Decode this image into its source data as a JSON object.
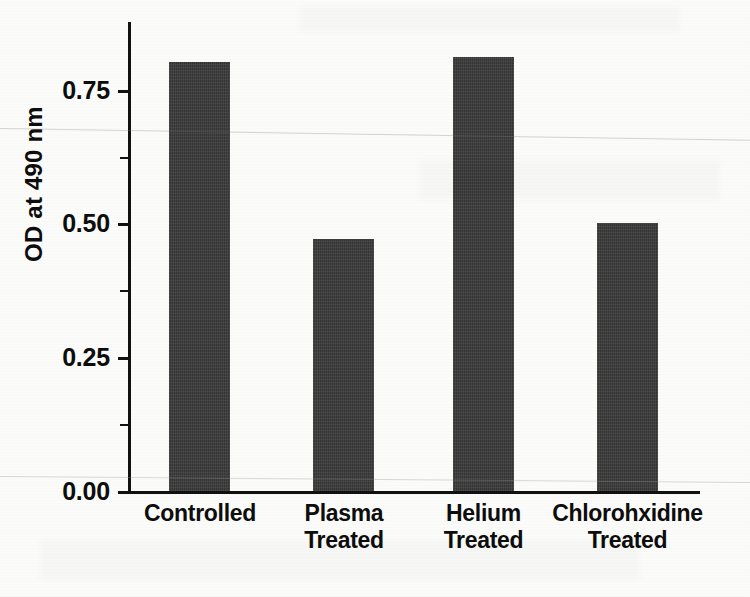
{
  "chart_data": {
    "type": "bar",
    "title": "",
    "xlabel": "",
    "ylabel": "OD at 490 nm",
    "ylim": [
      0.0,
      0.88
    ],
    "yticks": [
      "0.00",
      "0.25",
      "0.50",
      "0.75"
    ],
    "ytick_values": [
      0.0,
      0.25,
      0.5,
      0.75
    ],
    "minor_ticks": [
      0.125,
      0.375,
      0.625
    ],
    "grid": false,
    "legend": "none",
    "bar_color": "#3b3b3b",
    "categories": [
      "Controlled",
      "Plasma Treated",
      "Helium Treated",
      "Chlorohxidine Treated"
    ],
    "category_lines": [
      [
        "Controlled"
      ],
      [
        "Plasma",
        "Treated"
      ],
      [
        "Helium",
        "Treated"
      ],
      [
        "Chlorohxidine",
        "Treated"
      ]
    ],
    "values": [
      0.8,
      0.47,
      0.81,
      0.5
    ]
  },
  "axis": {
    "y_title": "OD at 490 nm",
    "tick_labels": {
      "t0": "0.00",
      "t1": "0.25",
      "t2": "0.50",
      "t3": "0.75"
    }
  },
  "labels": {
    "c0_l1": "Controlled",
    "c0_l2": "",
    "c1_l1": "Plasma",
    "c1_l2": "Treated",
    "c2_l1": "Helium",
    "c2_l2": "Treated",
    "c3_l1": "Chlorohxidine",
    "c3_l2": "Treated"
  }
}
